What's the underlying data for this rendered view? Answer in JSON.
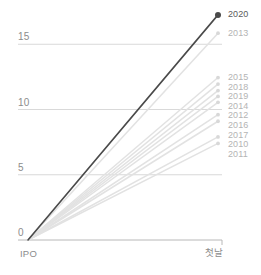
{
  "chart_data": {
    "type": "line",
    "title": "",
    "subtitle": "",
    "xlabel": "",
    "ylabel": "",
    "x": [
      "IPO",
      "첫날"
    ],
    "xtick_labels": [
      "IPO",
      "첫날"
    ],
    "ytick_labels": [
      "0",
      "5",
      "10",
      "15"
    ],
    "ytick_values": [
      0,
      5,
      10,
      15
    ],
    "ylim": [
      0,
      18
    ],
    "grid": "horizontal",
    "legend_position": "right-labels",
    "highlight_color": "#4a4a4a",
    "muted_color": "#e2e2e2",
    "gridline_color": "#cfcfcf",
    "axis_color": "#b0b0b0",
    "label_color": "#b4b4b4",
    "tick_color": "#8c8c8c",
    "series": [
      {
        "name": "2020",
        "values": [
          0,
          17.25
        ],
        "highlight": true,
        "color": "#4a4a4a",
        "marker": true
      },
      {
        "name": "2013",
        "values": [
          0,
          15.85
        ],
        "highlight": false,
        "color": "#e2e2e2",
        "marker": true
      },
      {
        "name": "2015",
        "values": [
          0,
          12.45
        ],
        "highlight": false,
        "color": "#e2e2e2",
        "marker": true
      },
      {
        "name": "2018",
        "values": [
          0,
          11.95
        ],
        "highlight": false,
        "color": "#e2e2e2",
        "marker": true
      },
      {
        "name": "2019",
        "values": [
          0,
          11.45
        ],
        "highlight": false,
        "color": "#e2e2e2",
        "marker": true
      },
      {
        "name": "2014",
        "values": [
          0,
          11.0
        ],
        "highlight": false,
        "color": "#e2e2e2",
        "marker": true
      },
      {
        "name": "2012",
        "values": [
          0,
          10.55
        ],
        "highlight": false,
        "color": "#e2e2e2",
        "marker": true
      },
      {
        "name": "2016",
        "values": [
          0,
          9.6
        ],
        "highlight": false,
        "color": "#e2e2e2",
        "marker": true
      },
      {
        "name": "2017",
        "values": [
          0,
          9.1
        ],
        "highlight": false,
        "color": "#e2e2e2",
        "marker": true
      },
      {
        "name": "2010",
        "values": [
          0,
          7.9
        ],
        "highlight": false,
        "color": "#e2e2e2",
        "marker": true
      },
      {
        "name": "2011",
        "values": [
          0,
          7.4
        ],
        "highlight": false,
        "color": "#e2e2e2",
        "marker": true
      }
    ]
  }
}
